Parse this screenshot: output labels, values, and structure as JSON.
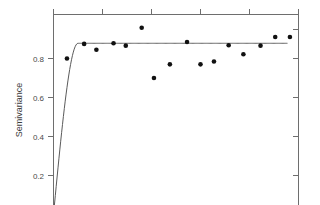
{
  "chart_data": {
    "type": "scatter",
    "title": "",
    "subtitle": "",
    "xlabel": "",
    "ylabel": "Semivariance",
    "ylim": [
      0.08,
      1.02
    ],
    "xlim": [
      0,
      1
    ],
    "grid": false,
    "legend": null,
    "y_ticks": [
      "0.8",
      "0.6",
      "0.4",
      "0.2"
    ],
    "y_tick_values": [
      0.8,
      0.6,
      0.4,
      0.2
    ],
    "x_ticks": [
      "",
      "",
      "",
      "",
      "",
      ""
    ],
    "axes_shown": [
      "left",
      "top",
      "right"
    ],
    "series": [
      {
        "name": "Empirical semivariance",
        "type": "scatter",
        "marker": "filled-circle",
        "color": "#111111",
        "x": [
          0.055,
          0.125,
          0.175,
          0.245,
          0.295,
          0.36,
          0.41,
          0.475,
          0.545,
          0.6,
          0.655,
          0.715,
          0.775,
          0.845,
          0.905,
          0.965
        ],
        "y": [
          0.8,
          0.875,
          0.845,
          0.878,
          0.866,
          0.958,
          0.7,
          0.77,
          0.885,
          0.77,
          0.785,
          0.868,
          0.822,
          0.866,
          0.91,
          0.91
        ]
      },
      {
        "name": "Fitted model (spherical)",
        "type": "line",
        "color": "#5a5a5a",
        "nugget": 0.0,
        "sill": 0.878,
        "range": 0.1
      }
    ]
  },
  "figure": {
    "ylabel_text": "Semivariance",
    "background": "#ffffff",
    "axis_color": "#6e6e6e",
    "point_color": "#111111",
    "curve_color": "#5a5a5a"
  }
}
